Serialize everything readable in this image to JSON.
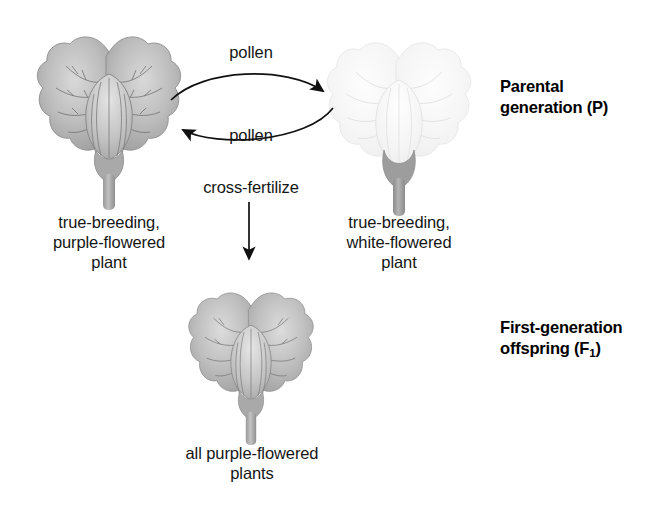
{
  "diagram": {
    "background_color": "#ffffff",
    "text_color": "#161616"
  },
  "parental": {
    "generation_label_line1": "Parental",
    "generation_label_line2_pre": "generation (P)",
    "left_plant": {
      "caption_line1": "true-breeding,",
      "caption_line2": "purple-flowered",
      "caption_line3": "plant",
      "flower_color": "#a8a8a8",
      "flower_name": "purple-flower"
    },
    "right_plant": {
      "caption_line1": "true-breeding,",
      "caption_line2": "white-flowered",
      "caption_line3": "plant",
      "flower_color": "#f4f4f4",
      "flower_name": "white-flower"
    },
    "arrow_top_label": "pollen",
    "arrow_bottom_label": "pollen"
  },
  "cross": {
    "label": "cross-fertilize"
  },
  "offspring": {
    "generation_label_line1": "First-generation",
    "generation_label_line2_pre": "offspring (F",
    "generation_label_sub": "1",
    "generation_label_line2_post": ")",
    "caption_line1": "all purple-flowered",
    "caption_line2": "plants",
    "flower_color": "#a8a8a8",
    "flower_name": "purple-flower"
  },
  "icons": {
    "arrow_right_curved": "curved-arrow-right-icon",
    "arrow_left_curved": "curved-arrow-left-icon",
    "arrow_down": "arrow-down-icon"
  }
}
